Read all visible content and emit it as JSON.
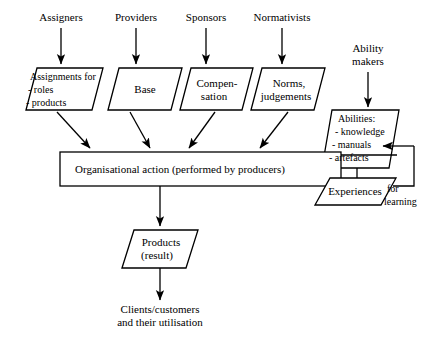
{
  "diagram": {
    "stroke_color": "#000000",
    "fill_color": "#ffffff",
    "actors": [
      {
        "id": "assigners",
        "label": "Assigners"
      },
      {
        "id": "providers",
        "label": "Providers"
      },
      {
        "id": "sponsors",
        "label": "Sponsors"
      },
      {
        "id": "normativists",
        "label": "Normativists"
      }
    ],
    "ability_makers": {
      "line1": "Ability",
      "line2": "makers"
    },
    "inputs": [
      {
        "id": "assignments",
        "line1": "Assignments for",
        "line2": "- roles",
        "line3": "- products"
      },
      {
        "id": "base",
        "line1": "Base"
      },
      {
        "id": "compensation",
        "line1": "Compen-",
        "line2": "sation"
      },
      {
        "id": "norms",
        "line1": "Norms,",
        "line2": "judgements"
      }
    ],
    "abilities": {
      "line1": "Abilities:",
      "line2": "- knowledge",
      "line3": "- manuals",
      "line4": "- artefacts"
    },
    "action": {
      "label": "Organisational action (performed by producers)"
    },
    "experiences": {
      "label": "Experiences"
    },
    "feedback": {
      "line1": "for",
      "line2": "learning"
    },
    "products": {
      "line1": "Products",
      "line2": "(result)"
    },
    "outcome": {
      "line1": "Clients/customers",
      "line2": "and their utilisation"
    }
  }
}
